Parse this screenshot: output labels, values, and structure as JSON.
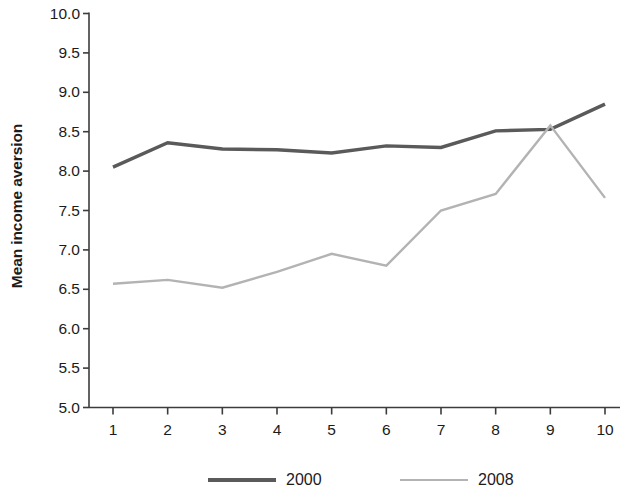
{
  "chart_data": {
    "type": "line",
    "title": "",
    "subtitle": "",
    "xlabel": "",
    "ylabel": "Mean income aversion",
    "x": [
      1,
      2,
      3,
      4,
      5,
      6,
      7,
      8,
      9,
      10
    ],
    "categories": [
      "1",
      "2",
      "3",
      "4",
      "5",
      "6",
      "7",
      "8",
      "9",
      "10"
    ],
    "xtick_labels": [
      "1",
      "2",
      "3",
      "4",
      "5",
      "6",
      "7",
      "8",
      "9",
      "10"
    ],
    "ytick_labels": [
      "5.0",
      "5.5",
      "6.0",
      "6.5",
      "7.0",
      "7.5",
      "8.0",
      "8.5",
      "9.0",
      "9.5",
      "10.0"
    ],
    "ytick_values": [
      5.0,
      5.5,
      6.0,
      6.5,
      7.0,
      7.5,
      8.0,
      8.5,
      9.0,
      9.5,
      10.0
    ],
    "xlim": [
      0.6,
      10.4
    ],
    "ylim": [
      5.0,
      10.0
    ],
    "grid": false,
    "legend_position": "bottom",
    "series": [
      {
        "name": "2000",
        "color": "#5a5a5a",
        "line_width": 3.4,
        "values": [
          8.05,
          8.36,
          8.28,
          8.27,
          8.23,
          8.32,
          8.3,
          8.51,
          8.53,
          8.85
        ]
      },
      {
        "name": "2008",
        "color": "#b3b3b3",
        "line_width": 2.4,
        "values": [
          6.57,
          6.62,
          6.52,
          6.72,
          6.95,
          6.8,
          7.5,
          7.71,
          8.58,
          7.66
        ]
      }
    ],
    "legend": [
      {
        "label": "2000",
        "color": "#5a5a5a"
      },
      {
        "label": "2008",
        "color": "#b3b3b3"
      }
    ],
    "axis_color": "#3c3c3c"
  }
}
